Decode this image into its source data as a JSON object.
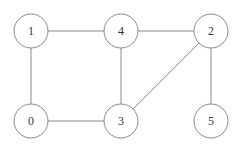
{
  "graph": {
    "nodes": [
      {
        "id": "1",
        "label": "1",
        "x": 31,
        "y": 31
      },
      {
        "id": "4",
        "label": "4",
        "x": 121,
        "y": 31
      },
      {
        "id": "2",
        "label": "2",
        "x": 211,
        "y": 31
      },
      {
        "id": "0",
        "label": "0",
        "x": 31,
        "y": 121
      },
      {
        "id": "3",
        "label": "3",
        "x": 121,
        "y": 121
      },
      {
        "id": "5",
        "label": "5",
        "x": 211,
        "y": 121
      }
    ],
    "edges": [
      {
        "from": "1",
        "to": "4"
      },
      {
        "from": "4",
        "to": "2"
      },
      {
        "from": "1",
        "to": "0"
      },
      {
        "from": "4",
        "to": "3"
      },
      {
        "from": "0",
        "to": "3"
      },
      {
        "from": "3",
        "to": "2"
      },
      {
        "from": "2",
        "to": "5"
      }
    ],
    "node_radius": 17
  }
}
